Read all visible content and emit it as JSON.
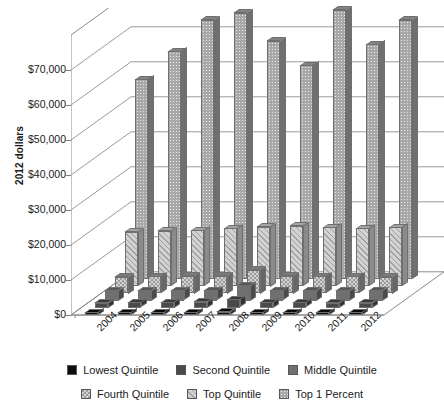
{
  "chart_data": {
    "type": "bar",
    "title": "",
    "xlabel": "",
    "ylabel": "2012 dollars",
    "categories": [
      "2004",
      "2005",
      "2006",
      "2007",
      "2008",
      "2009",
      "2010",
      "2011",
      "2012"
    ],
    "ylim": [
      0,
      80000
    ],
    "yticks": [
      "$0",
      "$10,000",
      "$20,000",
      "$30,000",
      "$40,000",
      "$50,000",
      "$60,000",
      "$70,000"
    ],
    "ytick_values": [
      0,
      10000,
      20000,
      30000,
      40000,
      50000,
      60000,
      70000
    ],
    "grid": true,
    "legend_position": "bottom",
    "threed": true,
    "series": [
      {
        "name": "Lowest Quintile",
        "color": "#0d0d0d",
        "pattern": "solid",
        "values": [
          500,
          520,
          540,
          560,
          900,
          520,
          500,
          500,
          500
        ]
      },
      {
        "name": "Second Quintile",
        "color": "#4a4a4a",
        "pattern": "solid",
        "values": [
          1500,
          1550,
          1600,
          1650,
          2400,
          1600,
          1550,
          1500,
          1500
        ]
      },
      {
        "name": "Middle Quintile",
        "color": "#707070",
        "pattern": "solid",
        "values": [
          2800,
          2850,
          2900,
          2950,
          4200,
          2900,
          2850,
          2800,
          2800
        ]
      },
      {
        "name": "Fourth Quintile",
        "color": "#9c9c9c",
        "pattern": "checker",
        "values": [
          4800,
          4900,
          5000,
          5100,
          6800,
          5000,
          4900,
          4850,
          4800
        ]
      },
      {
        "name": "Top Quintile",
        "color": "#d2d2d2",
        "pattern": "hatch",
        "values": [
          15500,
          15800,
          16000,
          16500,
          17000,
          17200,
          16800,
          16500,
          16800
        ]
      },
      {
        "name": "Top 1 Percent",
        "color": "#a8a8a8",
        "pattern": "dots",
        "values": [
          57000,
          65000,
          74000,
          76000,
          68000,
          61000,
          77000,
          67000,
          74000
        ]
      }
    ]
  },
  "axis": {
    "y_title": "2012 dollars"
  },
  "legend": {
    "rows": [
      [
        {
          "label": "Lowest Quintile",
          "swatch": "legend-swatch-lowest-quintile"
        },
        {
          "label": "Second Quintile",
          "swatch": "legend-swatch-second-quintile"
        },
        {
          "label": "Middle Quintile",
          "swatch": "legend-swatch-middle-quintile"
        }
      ],
      [
        {
          "label": "Fourth Quintile",
          "swatch": "legend-swatch-fourth-quintile"
        },
        {
          "label": "Top Quintile",
          "swatch": "legend-swatch-top-quintile"
        },
        {
          "label": "Top 1 Percent",
          "swatch": "legend-swatch-top-1-percent"
        }
      ]
    ]
  }
}
